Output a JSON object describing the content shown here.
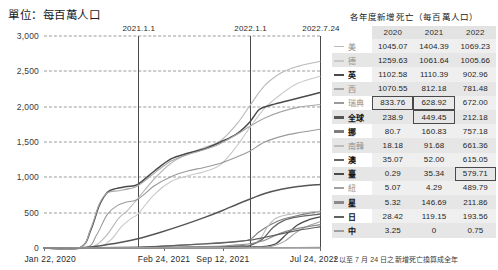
{
  "unit_label": "單位：每百萬人口",
  "chart_data": {
    "type": "line",
    "title": "",
    "xlabel": "",
    "ylabel": "單位：每百萬人口",
    "ylim": [
      0,
      3000
    ],
    "yticks": [
      "0",
      "500",
      "1,000",
      "1,500",
      "2,000",
      "2,500",
      "3,000"
    ],
    "ytick_values": [
      0,
      500,
      1000,
      1500,
      2000,
      2500,
      3000
    ],
    "xticks": [
      "Jan 22, 2020",
      "Feb 24, 2021",
      "Sep 12, 2021",
      "Jul 24, 2022"
    ],
    "xtick_positions": [
      0,
      0.435,
      0.648,
      1.0
    ],
    "vertical_markers": [
      {
        "label": "2021.1.1",
        "position": 0.34
      },
      {
        "label": "2022.1.1",
        "position": 0.745
      },
      {
        "label": "2022.7.24",
        "position": 1.0
      }
    ],
    "grid": true,
    "legend": "right-table",
    "series": [
      {
        "name": "美",
        "color": "#b9b9b9",
        "width": 1.1,
        "points": [
          [
            0,
            0
          ],
          [
            0.16,
            2
          ],
          [
            0.22,
            150
          ],
          [
            0.27,
            420
          ],
          [
            0.3,
            520
          ],
          [
            0.34,
            700
          ],
          [
            0.4,
            980
          ],
          [
            0.46,
            1200
          ],
          [
            0.52,
            1330
          ],
          [
            0.58,
            1420
          ],
          [
            0.64,
            1520
          ],
          [
            0.7,
            1760
          ],
          [
            0.745,
            2010
          ],
          [
            0.8,
            2300
          ],
          [
            0.86,
            2480
          ],
          [
            0.92,
            2570
          ],
          [
            1.0,
            2640
          ]
        ]
      },
      {
        "name": "德",
        "color": "#c9c9c9",
        "width": 1.1,
        "points": [
          [
            0,
            0
          ],
          [
            0.18,
            2
          ],
          [
            0.24,
            110
          ],
          [
            0.28,
            300
          ],
          [
            0.32,
            430
          ],
          [
            0.34,
            480
          ],
          [
            0.4,
            760
          ],
          [
            0.46,
            940
          ],
          [
            0.52,
            1020
          ],
          [
            0.58,
            1080
          ],
          [
            0.64,
            1180
          ],
          [
            0.7,
            1450
          ],
          [
            0.745,
            1700
          ],
          [
            0.8,
            1980
          ],
          [
            0.86,
            2180
          ],
          [
            0.92,
            2330
          ],
          [
            1.0,
            2430
          ]
        ]
      },
      {
        "name": "英",
        "color": "#4a4a4a",
        "width": 1.5,
        "points": [
          [
            0,
            0
          ],
          [
            0.13,
            4
          ],
          [
            0.17,
            260
          ],
          [
            0.2,
            600
          ],
          [
            0.23,
            790
          ],
          [
            0.26,
            840
          ],
          [
            0.3,
            870
          ],
          [
            0.34,
            900
          ],
          [
            0.4,
            1090
          ],
          [
            0.46,
            1260
          ],
          [
            0.52,
            1340
          ],
          [
            0.58,
            1400
          ],
          [
            0.64,
            1500
          ],
          [
            0.7,
            1620
          ],
          [
            0.745,
            1780
          ],
          [
            0.78,
            1960
          ],
          [
            0.82,
            2020
          ],
          [
            0.88,
            2080
          ],
          [
            0.94,
            2140
          ],
          [
            1.0,
            2200
          ]
        ]
      },
      {
        "name": "西",
        "color": "#a8a8a8",
        "width": 1.1,
        "points": [
          [
            0,
            0
          ],
          [
            0.13,
            3
          ],
          [
            0.17,
            280
          ],
          [
            0.2,
            620
          ],
          [
            0.23,
            780
          ],
          [
            0.27,
            810
          ],
          [
            0.31,
            840
          ],
          [
            0.34,
            880
          ],
          [
            0.4,
            1060
          ],
          [
            0.46,
            1230
          ],
          [
            0.52,
            1320
          ],
          [
            0.58,
            1390
          ],
          [
            0.64,
            1480
          ],
          [
            0.7,
            1610
          ],
          [
            0.745,
            1720
          ],
          [
            0.8,
            1840
          ],
          [
            0.86,
            1930
          ],
          [
            0.92,
            1990
          ],
          [
            1.0,
            2030
          ]
        ]
      },
      {
        "name": "瑞典",
        "color": "#9a9a9a",
        "width": 1.1,
        "points": [
          [
            0,
            0
          ],
          [
            0.15,
            3
          ],
          [
            0.19,
            180
          ],
          [
            0.23,
            480
          ],
          [
            0.27,
            610
          ],
          [
            0.3,
            650
          ],
          [
            0.34,
            690
          ],
          [
            0.4,
            880
          ],
          [
            0.46,
            1010
          ],
          [
            0.52,
            1090
          ],
          [
            0.58,
            1140
          ],
          [
            0.64,
            1200
          ],
          [
            0.7,
            1290
          ],
          [
            0.745,
            1370
          ],
          [
            0.8,
            1500
          ],
          [
            0.86,
            1580
          ],
          [
            0.92,
            1630
          ],
          [
            1.0,
            1680
          ]
        ]
      },
      {
        "name": "全球",
        "color": "#555555",
        "width": 1.5,
        "points": [
          [
            0,
            0
          ],
          [
            0.12,
            2
          ],
          [
            0.2,
            30
          ],
          [
            0.28,
            80
          ],
          [
            0.34,
            130
          ],
          [
            0.42,
            220
          ],
          [
            0.5,
            320
          ],
          [
            0.58,
            430
          ],
          [
            0.64,
            520
          ],
          [
            0.7,
            620
          ],
          [
            0.745,
            690
          ],
          [
            0.8,
            770
          ],
          [
            0.86,
            830
          ],
          [
            0.92,
            870
          ],
          [
            1.0,
            900
          ]
        ]
      },
      {
        "name": "挪",
        "color": "#7d7d7d",
        "width": 1.2,
        "points": [
          [
            0,
            0
          ],
          [
            0.3,
            5
          ],
          [
            0.4,
            18
          ],
          [
            0.5,
            40
          ],
          [
            0.58,
            60
          ],
          [
            0.64,
            75
          ],
          [
            0.7,
            95
          ],
          [
            0.745,
            120
          ],
          [
            0.78,
            230
          ],
          [
            0.82,
            330
          ],
          [
            0.86,
            400
          ],
          [
            0.92,
            460
          ],
          [
            1.0,
            520
          ]
        ]
      },
      {
        "name": "南韓",
        "color": "#bdbdbd",
        "width": 1.1,
        "points": [
          [
            0,
            0
          ],
          [
            0.3,
            3
          ],
          [
            0.45,
            10
          ],
          [
            0.58,
            16
          ],
          [
            0.66,
            22
          ],
          [
            0.72,
            30
          ],
          [
            0.745,
            36
          ],
          [
            0.78,
            110
          ],
          [
            0.81,
            300
          ],
          [
            0.84,
            420
          ],
          [
            0.88,
            470
          ],
          [
            0.94,
            500
          ],
          [
            1.0,
            520
          ]
        ]
      },
      {
        "name": "澳",
        "color": "#666666",
        "width": 1.3,
        "points": [
          [
            0,
            0
          ],
          [
            0.3,
            2
          ],
          [
            0.45,
            8
          ],
          [
            0.58,
            14
          ],
          [
            0.66,
            20
          ],
          [
            0.72,
            28
          ],
          [
            0.745,
            34
          ],
          [
            0.79,
            120
          ],
          [
            0.83,
            290
          ],
          [
            0.87,
            390
          ],
          [
            0.92,
            440
          ],
          [
            1.0,
            480
          ]
        ]
      },
      {
        "name": "臺",
        "color": "#4a4a4a",
        "width": 1.3,
        "points": [
          [
            0,
            0
          ],
          [
            0.4,
            1
          ],
          [
            0.6,
            2
          ],
          [
            0.7,
            6
          ],
          [
            0.745,
            12
          ],
          [
            0.8,
            24
          ],
          [
            0.84,
            60
          ],
          [
            0.88,
            200
          ],
          [
            0.92,
            330
          ],
          [
            0.96,
            400
          ],
          [
            1.0,
            440
          ]
        ]
      },
      {
        "name": "紐",
        "color": "#a0a0a0",
        "width": 1.1,
        "points": [
          [
            0,
            0
          ],
          [
            0.4,
            1
          ],
          [
            0.6,
            2
          ],
          [
            0.72,
            4
          ],
          [
            0.745,
            6
          ],
          [
            0.82,
            20
          ],
          [
            0.87,
            90
          ],
          [
            0.91,
            210
          ],
          [
            0.95,
            300
          ],
          [
            1.0,
            370
          ]
        ]
      },
      {
        "name": "星",
        "color": "#8a8a8a",
        "width": 1.2,
        "points": [
          [
            0,
            0
          ],
          [
            0.3,
            2
          ],
          [
            0.5,
            8
          ],
          [
            0.62,
            22
          ],
          [
            0.7,
            45
          ],
          [
            0.745,
            60
          ],
          [
            0.8,
            110
          ],
          [
            0.85,
            200
          ],
          [
            0.9,
            260
          ],
          [
            0.95,
            300
          ],
          [
            1.0,
            330
          ]
        ]
      },
      {
        "name": "日",
        "color": "#606060",
        "width": 1.2,
        "points": [
          [
            0,
            0
          ],
          [
            0.2,
            4
          ],
          [
            0.34,
            14
          ],
          [
            0.45,
            30
          ],
          [
            0.55,
            50
          ],
          [
            0.64,
            70
          ],
          [
            0.7,
            90
          ],
          [
            0.745,
            110
          ],
          [
            0.8,
            150
          ],
          [
            0.86,
            200
          ],
          [
            0.92,
            250
          ],
          [
            1.0,
            300
          ]
        ]
      },
      {
        "name": "中",
        "color": "#9e9e9e",
        "width": 1.2,
        "points": [
          [
            0,
            0
          ],
          [
            0.2,
            3
          ],
          [
            0.4,
            4
          ],
          [
            0.6,
            4
          ],
          [
            0.745,
            5
          ],
          [
            0.85,
            6
          ],
          [
            1.0,
            8
          ]
        ]
      }
    ]
  },
  "table": {
    "title": "各年度新增死亡（每百萬人口）",
    "columns": [
      "2020",
      "2021",
      "2022"
    ],
    "rows": [
      {
        "name": "美",
        "color": "#b9b9b9",
        "bold": false,
        "values": [
          "1045.07",
          "1404.39",
          "1069.23"
        ],
        "boxed": [
          false,
          false,
          false
        ]
      },
      {
        "name": "德",
        "color": "#c9c9c9",
        "bold": false,
        "values": [
          "1259.63",
          "1061.64",
          "1005.66"
        ],
        "boxed": [
          false,
          false,
          false
        ]
      },
      {
        "name": "英",
        "color": "#4a4a4a",
        "bold": true,
        "values": [
          "1102.58",
          "1110.39",
          "902.96"
        ],
        "boxed": [
          false,
          false,
          false
        ]
      },
      {
        "name": "西",
        "color": "#a8a8a8",
        "bold": false,
        "values": [
          "1070.55",
          "812.18",
          "781.48"
        ],
        "boxed": [
          false,
          false,
          false
        ]
      },
      {
        "name": "瑞典",
        "color": "#9a9a9a",
        "bold": false,
        "values": [
          "833.76",
          "628.92",
          "672.00"
        ],
        "boxed": [
          true,
          true,
          false
        ]
      },
      {
        "name": "全球",
        "color": "#555555",
        "bold": true,
        "values": [
          "238.9",
          "449.45",
          "212.18"
        ],
        "boxed": [
          false,
          true,
          false
        ]
      },
      {
        "name": "挪",
        "color": "#7d7d7d",
        "bold": true,
        "values": [
          "80.7",
          "160.83",
          "757.18"
        ],
        "boxed": [
          false,
          false,
          false
        ]
      },
      {
        "name": "南韓",
        "color": "#bdbdbd",
        "bold": false,
        "values": [
          "18.18",
          "91.68",
          "661.36"
        ],
        "boxed": [
          false,
          false,
          false
        ]
      },
      {
        "name": "澳",
        "color": "#666666",
        "bold": true,
        "values": [
          "35.07",
          "52.00",
          "615.05"
        ],
        "boxed": [
          false,
          false,
          false
        ]
      },
      {
        "name": "臺",
        "color": "#4a4a4a",
        "bold": true,
        "values": [
          "0.29",
          "35.34",
          "579.71"
        ],
        "boxed": [
          false,
          false,
          true
        ]
      },
      {
        "name": "紐",
        "color": "#a0a0a0",
        "bold": false,
        "values": [
          "5.07",
          "4.29",
          "489.79"
        ],
        "boxed": [
          false,
          false,
          false
        ]
      },
      {
        "name": "星",
        "color": "#8a8a8a",
        "bold": true,
        "values": [
          "5.32",
          "146.69",
          "211.86"
        ],
        "boxed": [
          false,
          false,
          false
        ]
      },
      {
        "name": "日",
        "color": "#606060",
        "bold": true,
        "values": [
          "28.42",
          "119.15",
          "193.56"
        ],
        "boxed": [
          false,
          false,
          false
        ]
      },
      {
        "name": "中",
        "color": "#9e9e9e",
        "bold": true,
        "values": [
          "3.25",
          "0",
          "0.75"
        ],
        "boxed": [
          false,
          false,
          false
        ]
      }
    ],
    "footnote": "* 以至 7 月 24 日之新增死亡換算成全年"
  }
}
